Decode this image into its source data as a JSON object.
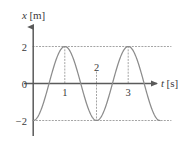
{
  "chart_data": {
    "type": "line",
    "title": "",
    "subtitle": "",
    "xlabel": "t [s]",
    "ylabel": "x [m]",
    "xlabel_var": "t",
    "xlabel_unit": "[s]",
    "ylabel_var": "x",
    "ylabel_unit": "[m]",
    "xlim": [
      -0.12,
      4.35
    ],
    "ylim": [
      -2.85,
      2.95
    ],
    "xticks": [
      1,
      2,
      3
    ],
    "xtick_labels": [
      "1",
      "2",
      "3"
    ],
    "yticks": [
      2,
      0,
      -2
    ],
    "ytick_labels": [
      "2",
      "0",
      "−2"
    ],
    "grid": false,
    "gridlines_dotted": [
      2,
      -2
    ],
    "droplines_dotted_x": [
      1,
      2,
      3
    ],
    "legend": null,
    "legend_position": "none",
    "series": [
      {
        "name": "x(t)",
        "equation": "x(t) = -2 cos(pi t)",
        "amplitude": 2,
        "period": 2,
        "phase_deg": 180,
        "color": "#8c8c8c",
        "x": [
          0.0,
          0.1,
          0.2,
          0.3,
          0.4,
          0.5,
          0.6,
          0.7,
          0.8,
          0.9,
          1.0,
          1.1,
          1.2,
          1.3,
          1.4,
          1.5,
          1.6,
          1.7,
          1.8,
          1.9,
          2.0,
          2.1,
          2.2,
          2.3,
          2.4,
          2.5,
          2.6,
          2.7,
          2.8,
          2.9,
          3.0,
          3.1,
          3.2,
          3.3,
          3.4,
          3.5,
          3.6,
          3.7,
          3.8,
          3.9,
          4.0
        ],
        "values": [
          -2.0,
          -1.9,
          -1.62,
          -1.18,
          -0.62,
          0.0,
          0.62,
          1.18,
          1.62,
          1.9,
          2.0,
          1.9,
          1.62,
          1.18,
          0.62,
          0.0,
          -0.62,
          -1.18,
          -1.62,
          -1.9,
          -2.0,
          -1.9,
          -1.62,
          -1.18,
          -0.62,
          0.0,
          0.62,
          1.18,
          1.62,
          1.9,
          2.0,
          1.9,
          1.62,
          1.18,
          0.62,
          0.0,
          -0.62,
          -1.18,
          -1.62,
          -1.9,
          -2.0
        ]
      }
    ],
    "annotations": [
      {
        "text": "1",
        "x": 1,
        "y": 0,
        "position": "below-axis"
      },
      {
        "text": "2",
        "x": 2,
        "y": 0,
        "position": "above-axis"
      },
      {
        "text": "3",
        "x": 3,
        "y": 0,
        "position": "below-axis"
      }
    ],
    "colors": {
      "curve": "#8c8c8c",
      "axis": "#5a5a5a",
      "gridline": "#9a9a9a",
      "dropline": "#9a9a9a",
      "text": "#3a3a3a",
      "background": "#ffffff"
    }
  }
}
